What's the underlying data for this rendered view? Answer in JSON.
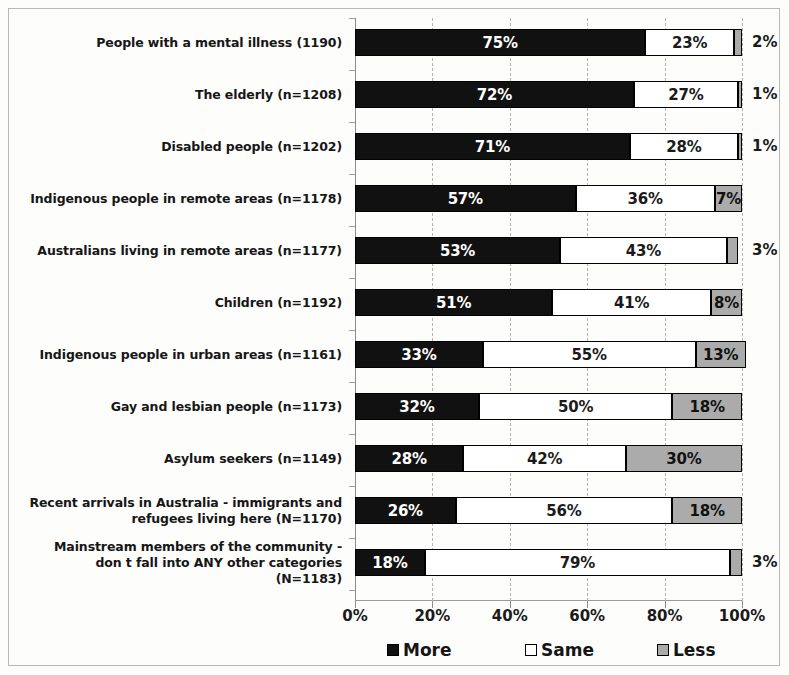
{
  "chart_data": {
    "type": "bar",
    "subtype": "stacked-horizontal-100pct",
    "title": "",
    "xlabel": "",
    "ylabel": "",
    "xlim": [
      0,
      100
    ],
    "xticks": [
      "0%",
      "20%",
      "40%",
      "60%",
      "80%",
      "100%"
    ],
    "xtick_values": [
      0,
      20,
      40,
      60,
      80,
      100
    ],
    "grid": true,
    "legend_position": "bottom",
    "legend": [
      "More",
      "Same",
      "Less"
    ],
    "colors": {
      "more": "#111111",
      "same": "#ffffff",
      "less": "#ababab",
      "outline": "#000000",
      "grid": "#b5b5b5",
      "axis": "#8d8d8d"
    },
    "categories": [
      "People with a mental illness (1190)",
      "The elderly (n=1208)",
      "Disabled people (n=1202)",
      "Indigenous people in remote areas (n=1178)",
      "Australians living in remote areas (n=1177)",
      "Children (n=1192)",
      "Indigenous people in urban areas (n=1161)",
      "Gay and lesbian people (n=1173)",
      "Asylum seekers (n=1149)",
      "Recent arrivals in Australia - immigrants and refugees living here (N=1170)",
      "Mainstream members of the community - don t fall into ANY other categories (N=1183)"
    ],
    "series": [
      {
        "name": "More",
        "values": [
          75,
          72,
          71,
          57,
          53,
          51,
          33,
          32,
          28,
          26,
          18
        ]
      },
      {
        "name": "Same",
        "values": [
          23,
          27,
          28,
          36,
          43,
          41,
          55,
          50,
          42,
          56,
          79
        ]
      },
      {
        "name": "Less",
        "values": [
          2,
          1,
          1,
          7,
          3,
          8,
          13,
          18,
          30,
          18,
          3
        ]
      }
    ],
    "rows": [
      {
        "label_lines": [
          "People with a mental illness (1190)"
        ],
        "more": 75,
        "same": 23,
        "less": 2,
        "more_label": "75%",
        "same_label": "23%",
        "less_label": "2%",
        "less_label_outside": true
      },
      {
        "label_lines": [
          "The elderly (n=1208)"
        ],
        "more": 72,
        "same": 27,
        "less": 1,
        "more_label": "72%",
        "same_label": "27%",
        "less_label": "1%",
        "less_label_outside": true
      },
      {
        "label_lines": [
          "Disabled people (n=1202)"
        ],
        "more": 71,
        "same": 28,
        "less": 1,
        "more_label": "71%",
        "same_label": "28%",
        "less_label": "1%",
        "less_label_outside": true
      },
      {
        "label_lines": [
          "Indigenous people in remote areas (n=1178)"
        ],
        "more": 57,
        "same": 36,
        "less": 7,
        "more_label": "57%",
        "same_label": "36%",
        "less_label": "7%",
        "less_label_outside": false
      },
      {
        "label_lines": [
          "Australians living in remote areas (n=1177)"
        ],
        "more": 53,
        "same": 43,
        "less": 3,
        "more_label": "53%",
        "same_label": "43%",
        "less_label": "3%",
        "less_label_outside": true
      },
      {
        "label_lines": [
          "Children (n=1192)"
        ],
        "more": 51,
        "same": 41,
        "less": 8,
        "more_label": "51%",
        "same_label": "41%",
        "less_label": "8%",
        "less_label_outside": false
      },
      {
        "label_lines": [
          "Indigenous people in urban areas (n=1161)"
        ],
        "more": 33,
        "same": 55,
        "less": 13,
        "more_label": "33%",
        "same_label": "55%",
        "less_label": "13%",
        "less_label_outside": false
      },
      {
        "label_lines": [
          "Gay and lesbian people (n=1173)"
        ],
        "more": 32,
        "same": 50,
        "less": 18,
        "more_label": "32%",
        "same_label": "50%",
        "less_label": "18%",
        "less_label_outside": false
      },
      {
        "label_lines": [
          "Asylum seekers (n=1149)"
        ],
        "more": 28,
        "same": 42,
        "less": 30,
        "more_label": "28%",
        "same_label": "42%",
        "less_label": "30%",
        "less_label_outside": false
      },
      {
        "label_lines": [
          "Recent arrivals in Australia - immigrants and",
          "refugees living here (N=1170)"
        ],
        "more": 26,
        "same": 56,
        "less": 18,
        "more_label": "26%",
        "same_label": "56%",
        "less_label": "18%",
        "less_label_outside": false
      },
      {
        "label_lines": [
          "Mainstream members of the community -",
          "don t fall into ANY other categories",
          "(N=1183)"
        ],
        "more": 18,
        "same": 79,
        "less": 3,
        "more_label": "18%",
        "same_label": "79%",
        "less_label": "3%",
        "less_label_outside": true
      }
    ]
  }
}
